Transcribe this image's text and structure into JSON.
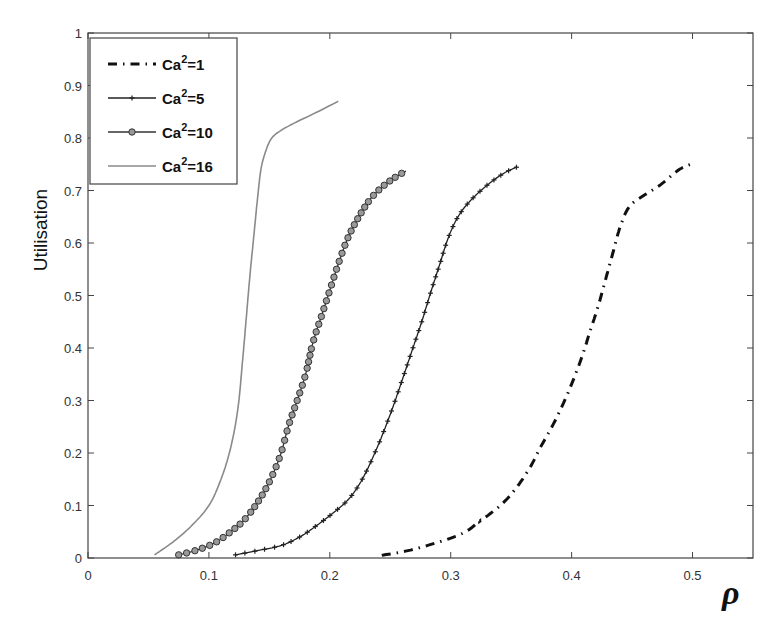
{
  "chart_data": {
    "type": "line",
    "title": "",
    "xlabel": "ρ",
    "ylabel": "Utilisation",
    "xlim": [
      0,
      0.55
    ],
    "ylim": [
      0,
      1
    ],
    "xticks": [
      0,
      0.1,
      0.2,
      0.3,
      0.4,
      0.5
    ],
    "xtick_labels": [
      "0",
      "0.1",
      "0.2",
      "0.3",
      "0.4",
      "0.5"
    ],
    "yticks": [
      0,
      0.1,
      0.2,
      0.3,
      0.4,
      0.5,
      0.6,
      0.7,
      0.8,
      0.9,
      1
    ],
    "ytick_labels": [
      "0",
      "0.1",
      "0.2",
      "0.3",
      "0.4",
      "0.5",
      "0.6",
      "0.7",
      "0.8",
      "0.9",
      "1"
    ],
    "grid": false,
    "legend_position": "upper left",
    "series": [
      {
        "name": "Ca²=1",
        "label_base": "Ca",
        "label_sup": "2",
        "label_rest": "=1",
        "style": "dashdot",
        "color": "#111111",
        "marker": "none",
        "x": [
          0.243,
          0.27,
          0.307,
          0.324,
          0.341,
          0.353,
          0.365,
          0.374,
          0.386,
          0.398,
          0.408,
          0.415,
          0.422,
          0.428,
          0.434,
          0.44,
          0.447,
          0.456,
          0.473,
          0.489,
          0.501
        ],
        "y": [
          0.005,
          0.017,
          0.044,
          0.07,
          0.1,
          0.13,
          0.17,
          0.21,
          0.26,
          0.32,
          0.38,
          0.43,
          0.48,
          0.53,
          0.58,
          0.63,
          0.667,
          0.685,
          0.71,
          0.74,
          0.752
        ]
      },
      {
        "name": "Ca²=5",
        "label_base": "Ca",
        "label_sup": "2",
        "label_rest": "=5",
        "style": "solid",
        "color": "#222222",
        "marker": "plus",
        "x": [
          0.122,
          0.14,
          0.16,
          0.175,
          0.188,
          0.205,
          0.217,
          0.228,
          0.24,
          0.251,
          0.26,
          0.268,
          0.276,
          0.284,
          0.291,
          0.298,
          0.306,
          0.316,
          0.33,
          0.344,
          0.355
        ],
        "y": [
          0.006,
          0.014,
          0.024,
          0.04,
          0.06,
          0.09,
          0.116,
          0.155,
          0.215,
          0.28,
          0.34,
          0.395,
          0.45,
          0.51,
          0.56,
          0.61,
          0.65,
          0.68,
          0.71,
          0.733,
          0.745
        ]
      },
      {
        "name": "Ca²=10",
        "label_base": "Ca",
        "label_sup": "2",
        "label_rest": "=10",
        "style": "solid",
        "color": "#333333",
        "marker": "circle",
        "x": [
          0.075,
          0.09,
          0.105,
          0.118,
          0.129,
          0.14,
          0.15,
          0.159,
          0.166,
          0.173,
          0.18,
          0.186,
          0.193,
          0.2,
          0.207,
          0.215,
          0.224,
          0.234,
          0.245,
          0.256,
          0.263
        ],
        "y": [
          0.006,
          0.015,
          0.029,
          0.05,
          0.072,
          0.105,
          0.145,
          0.195,
          0.253,
          0.3,
          0.35,
          0.41,
          0.46,
          0.51,
          0.56,
          0.61,
          0.65,
          0.685,
          0.71,
          0.728,
          0.737
        ]
      },
      {
        "name": "Ca²=16",
        "label_base": "Ca",
        "label_sup": "2",
        "label_rest": "=16",
        "style": "solid",
        "color": "#8a8a8a",
        "marker": "none",
        "x": [
          0.055,
          0.07,
          0.085,
          0.1,
          0.11,
          0.118,
          0.124,
          0.128,
          0.131,
          0.134,
          0.137,
          0.14,
          0.143,
          0.147,
          0.152,
          0.16,
          0.172,
          0.19,
          0.207
        ],
        "y": [
          0.006,
          0.03,
          0.06,
          0.1,
          0.15,
          0.21,
          0.285,
          0.38,
          0.46,
          0.54,
          0.61,
          0.68,
          0.74,
          0.775,
          0.8,
          0.815,
          0.83,
          0.85,
          0.87
        ]
      }
    ]
  }
}
